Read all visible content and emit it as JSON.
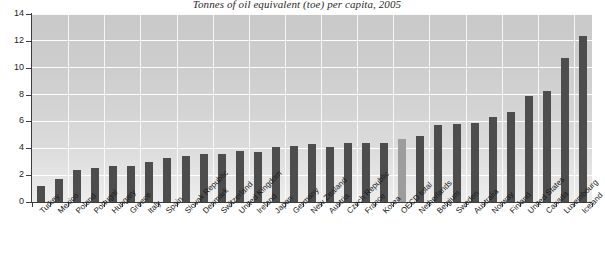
{
  "chart_data": {
    "type": "bar",
    "title": "Tonnes of oil equivalent (toe) per capita, 2005",
    "xlabel": "",
    "ylabel": "",
    "ylim": [
      0,
      14
    ],
    "ytick_step": 2,
    "ytick_labels": [
      "0",
      "2",
      "4",
      "6",
      "8",
      "10",
      "12",
      "14"
    ],
    "grid": true,
    "legend": "none",
    "highlight_category": "OECD total",
    "bar_color": "#4d4d4d",
    "highlight_color": "#9d9d9d",
    "categories": [
      "Turkey",
      "Mexico",
      "Poland",
      "Portugal",
      "Hungary",
      "Greece",
      "Italy",
      "Spain",
      "Slovak Republic",
      "Denmark",
      "Switzerland",
      "United Kingdom",
      "Ireland",
      "Japan",
      "Germany",
      "New Zealand",
      "Austria",
      "Czech Republic",
      "France",
      "Korea",
      "OECD total",
      "Netherlands",
      "Belgium",
      "Sweden",
      "Australia",
      "Norway",
      "Finland",
      "United States",
      "Canada",
      "Luxembourg",
      "Iceland"
    ],
    "values": [
      1.2,
      1.7,
      2.4,
      2.5,
      2.7,
      2.7,
      3.0,
      3.3,
      3.4,
      3.6,
      3.6,
      3.8,
      3.7,
      4.1,
      4.2,
      4.3,
      4.1,
      4.4,
      4.4,
      4.4,
      4.7,
      4.9,
      5.7,
      5.8,
      5.9,
      6.3,
      6.7,
      7.9,
      8.3,
      10.7,
      12.4
    ]
  }
}
